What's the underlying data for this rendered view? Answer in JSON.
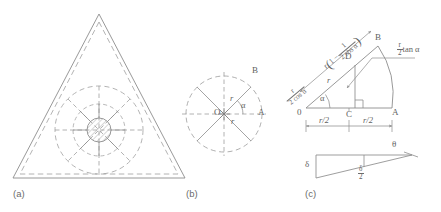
{
  "figure": {
    "panels": [
      {
        "id": "a",
        "caption": "(a)",
        "description": "equilateral triangular duct cross-section with inscribed dashed circle, hatched central hub and radial spokes"
      },
      {
        "id": "b",
        "caption": "(b)",
        "description": "circular detail with radial spokes, center O, points A and B, radius r and angle alpha"
      },
      {
        "id": "c",
        "caption": "(c)",
        "description": "geometric construction with trigonometric length annotations and a thin wedge triangle"
      }
    ]
  },
  "panel_a": {
    "caption": "(a)",
    "outline": "solid triangle with inner dashed offset triangle",
    "hub": "hatched circle",
    "spokes": 8
  },
  "panel_b": {
    "caption": "(b)",
    "center_label": "O",
    "point_a": "A",
    "point_b": "B",
    "radius_label": "r",
    "angle_label": "α",
    "spokes": 8
  },
  "panel_c": {
    "caption": "(c)",
    "origin_label": "0",
    "point_a": "A",
    "point_b": "B",
    "point_c": "C",
    "point_d": "D",
    "angle_label": "α",
    "radius_label": "r",
    "dim_left": "r/2",
    "dim_right": "r/2",
    "hyp_numer": "r",
    "hyp_denom": "2 cos α",
    "expr_lead": "r",
    "expr_open": "(",
    "expr_one": "1 −",
    "expr_frac_numer": "1",
    "expr_frac_denom": "2 cos α",
    "expr_close": ")",
    "tan_numer": "r",
    "tan_denom": "2",
    "tan_text": "tan α"
  },
  "panel_c_wedge": {
    "delta_label": "δ",
    "half_delta_numer": "δ",
    "half_delta_denom": "2",
    "theta_label": "θ"
  },
  "style": {
    "line_color": "#8d8d8d",
    "dash_color": "#9a9a9a",
    "text_color": "#5f5f5f",
    "background": "#ffffff"
  }
}
